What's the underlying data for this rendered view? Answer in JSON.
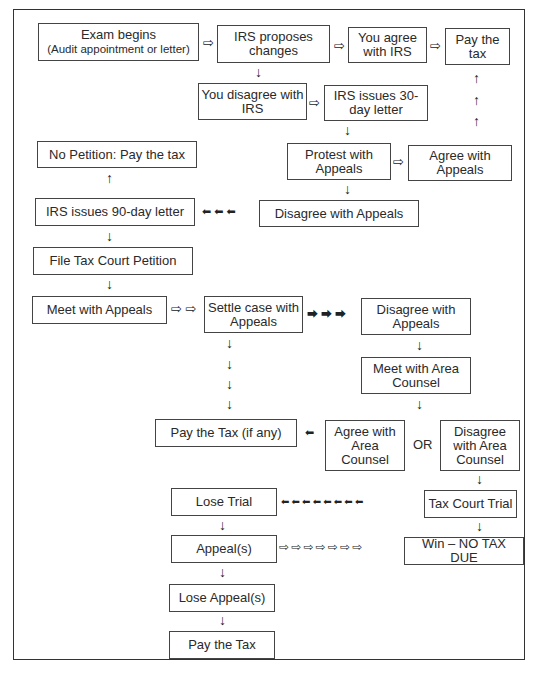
{
  "diagram": {
    "nodes": {
      "exam_begins": {
        "label": "Exam begins",
        "sub": "(Audit appointment or letter)"
      },
      "irs_proposes": {
        "label": "IRS proposes changes"
      },
      "you_agree": {
        "label": "You agree with IRS"
      },
      "pay_tax_top": {
        "label": "Pay the tax"
      },
      "you_disagree": {
        "label": "You disagree with IRS"
      },
      "irs_30day": {
        "label": "IRS issues 30-day letter"
      },
      "no_petition": {
        "label": "No Petition: Pay the tax"
      },
      "protest_appeals": {
        "label": "Protest with Appeals"
      },
      "agree_appeals": {
        "label": "Agree with Appeals"
      },
      "irs_90day": {
        "label": "IRS issues 90-day letter"
      },
      "disagree_appeals_1": {
        "label": "Disagree with Appeals"
      },
      "file_petition": {
        "label": "File Tax Court Petition"
      },
      "meet_appeals": {
        "label": "Meet with Appeals"
      },
      "settle_case": {
        "label": "Settle case with Appeals"
      },
      "disagree_appeals_2": {
        "label": "Disagree with Appeals"
      },
      "meet_counsel": {
        "label": "Meet with Area Counsel"
      },
      "pay_if_any": {
        "label": "Pay the Tax (if any)"
      },
      "agree_counsel": {
        "label": "Agree with Area Counsel"
      },
      "or_label": "OR",
      "disagree_counsel": {
        "label": "Disagree with Area Counsel"
      },
      "lose_trial": {
        "label": "Lose Trial"
      },
      "tax_court_trial": {
        "label": "Tax Court Trial"
      },
      "appeals": {
        "label": "Appeal(s)"
      },
      "win": {
        "label": "Win – NO TAX DUE"
      },
      "lose_appeals": {
        "label": "Lose Appeal(s)"
      },
      "pay_tax_bottom": {
        "label": "Pay the Tax"
      }
    },
    "arrows": {
      "open_right": "⇨",
      "down": "↓",
      "up": "↑",
      "solid_left": "⬅",
      "solid_right": "⮕",
      "left3": "⬅ ⬅ ⬅",
      "right3": "⮕ ⮕ ⮕",
      "left8": "⬅ ⬅ ⬅ ⬅ ⬅ ⬅ ⬅ ⬅",
      "open_right2": "⇨ ⇨",
      "open_right7": "⇨ ⇨ ⇨ ⇨ ⇨ ⇨ ⇨"
    }
  }
}
